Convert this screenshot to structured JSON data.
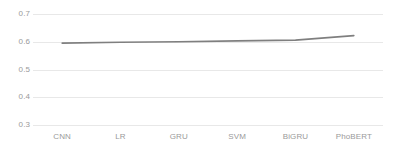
{
  "chart_data": {
    "type": "line",
    "title": "",
    "subtitle": "",
    "xlabel": "",
    "ylabel": "",
    "categories": [
      "CNN",
      "LR",
      "GRU",
      "SVM",
      "BiGRU",
      "PhoBERT"
    ],
    "series": [
      {
        "name": "",
        "values": [
          0.595,
          0.598,
          0.6,
          0.603,
          0.606,
          0.622
        ]
      }
    ],
    "ylim": [
      0.3,
      0.7
    ],
    "yticks": [
      0.3,
      0.4,
      0.5,
      0.6,
      0.7
    ],
    "ytick_labels": [
      "0.3",
      "0.4",
      "0.5",
      "0.6",
      "0.7"
    ],
    "grid": true,
    "grid_axis": "y",
    "legend": false,
    "legend_position": "none",
    "colors": {
      "line": "#7f7f7f",
      "gridline": "#e8e8e8",
      "tick_label": "#9a9a9a",
      "background": "#ffffff"
    }
  }
}
